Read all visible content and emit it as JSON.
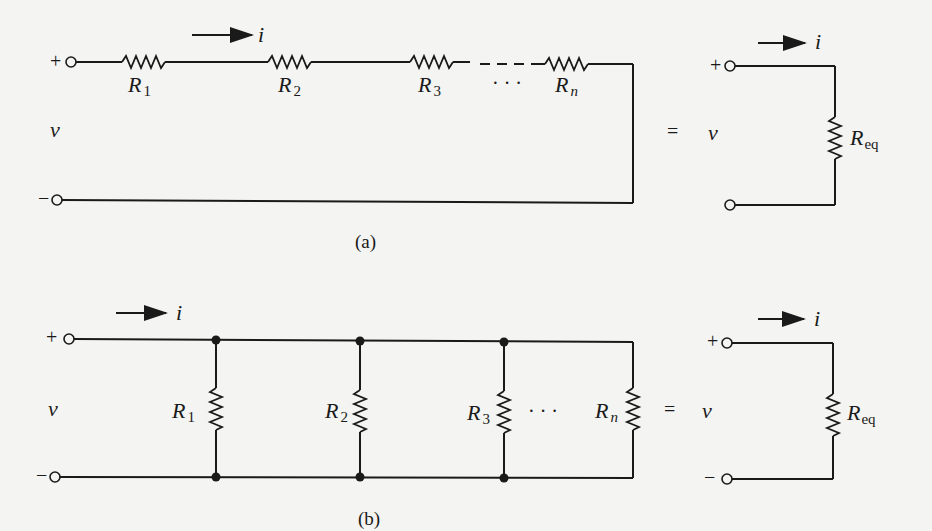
{
  "figure": {
    "a": {
      "caption": "(a)",
      "type": "series",
      "current_label": "i",
      "voltage_label": "v",
      "plus_sign": "+",
      "minus_sign": "−",
      "resistors": [
        {
          "base": "R",
          "sub": "1"
        },
        {
          "base": "R",
          "sub": "2"
        },
        {
          "base": "R",
          "sub": "3"
        },
        {
          "base": "R",
          "sub": "n"
        }
      ],
      "ellipsis": "· · ·",
      "equals": "=",
      "equivalent": {
        "base": "R",
        "sub": "eq",
        "current_label": "i",
        "voltage_label": "v",
        "plus_sign": "+",
        "minus_sign": "−"
      }
    },
    "b": {
      "caption": "(b)",
      "type": "parallel",
      "current_label": "i",
      "voltage_label": "v",
      "plus_sign": "+",
      "minus_sign": "−",
      "resistors": [
        {
          "base": "R",
          "sub": "1"
        },
        {
          "base": "R",
          "sub": "2"
        },
        {
          "base": "R",
          "sub": "3"
        },
        {
          "base": "R",
          "sub": "n"
        }
      ],
      "ellipsis": "· · ·",
      "equals": "=",
      "equivalent": {
        "base": "R",
        "sub": "eq",
        "current_label": "i",
        "voltage_label": "v",
        "plus_sign": "+",
        "minus_sign": "−"
      }
    }
  }
}
